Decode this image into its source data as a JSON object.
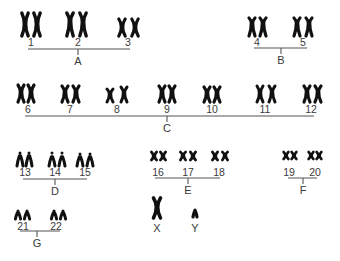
{
  "groups": [
    {
      "label": "A",
      "chromosomes": [
        "1",
        "2",
        "3"
      ]
    },
    {
      "label": "B",
      "chromosomes": [
        "4",
        "5"
      ]
    },
    {
      "label": "C",
      "chromosomes": [
        "6",
        "7",
        "8",
        "9",
        "10",
        "11",
        "12"
      ]
    },
    {
      "label": "D",
      "chromosomes": [
        "13",
        "14",
        "15"
      ]
    },
    {
      "label": "E",
      "chromosomes": [
        "16",
        "17",
        "18"
      ]
    },
    {
      "label": "F",
      "chromosomes": [
        "19",
        "20"
      ]
    },
    {
      "label": "G",
      "chromosomes": [
        "21",
        "22"
      ]
    }
  ],
  "sex_chromosomes": {
    "x": "X",
    "y": "Y"
  },
  "colors": {
    "chromosome": "#111111",
    "bracket": "#555555",
    "text": "#3a3a3a"
  }
}
